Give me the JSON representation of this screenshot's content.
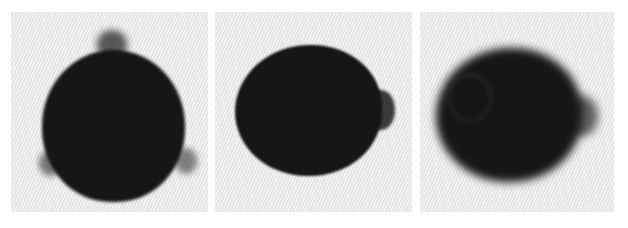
{
  "figure": {
    "caption_fragment": "",
    "panel_count": 3,
    "background_color": "#ededed",
    "object_color": "#161616",
    "panels": [
      {
        "index": 1,
        "description": "Dark near-circular blob with three faint protruding lobes (top, lower-left, lower-right)",
        "blur": "sharp"
      },
      {
        "index": 2,
        "description": "Dark oval blob with a single lobe protruding on the right side",
        "blur": "sharp"
      },
      {
        "index": 3,
        "description": "Blurred dark oval blob with a soft lobe on the right side",
        "blur": "blurred"
      }
    ]
  }
}
